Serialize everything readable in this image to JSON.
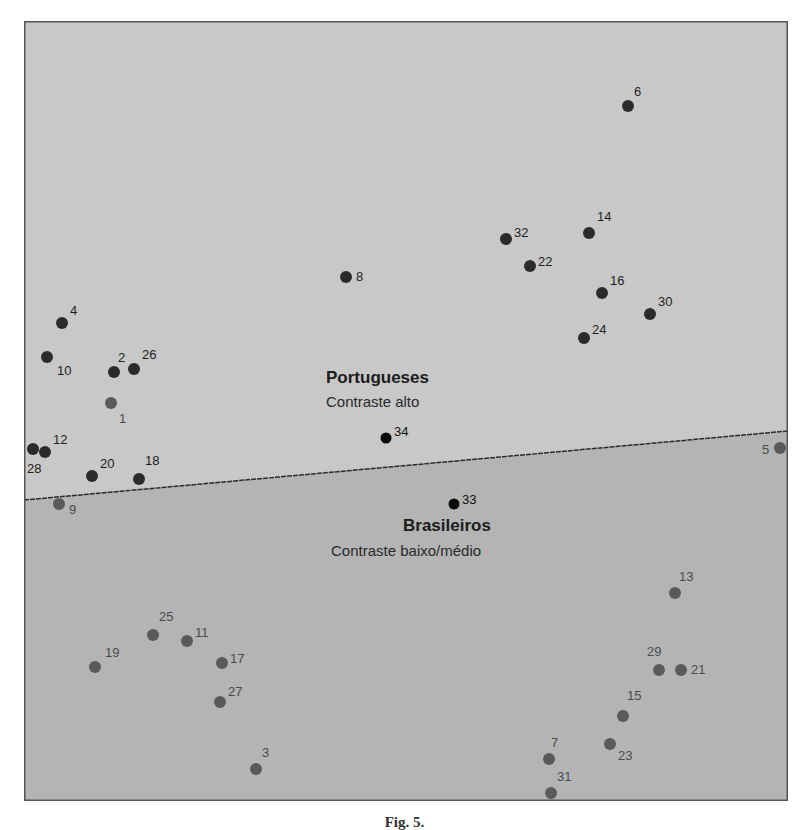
{
  "chart_data": {
    "type": "scatter",
    "title": "",
    "xlabel": "",
    "ylabel": "",
    "grid": false,
    "legend": "none",
    "regions": [
      {
        "name": "Portugueses",
        "subtitle": "Contraste alto",
        "fill": "#c8c8c8",
        "position": "above-line"
      },
      {
        "name": "Brasileiros",
        "subtitle": "Contraste baixo/médio",
        "fill": "#b4b4b4",
        "position": "below-line"
      }
    ],
    "divider_line": {
      "x1": 0,
      "y1": 479,
      "x2": 764,
      "y2": 410,
      "style": "dashed",
      "color": "#2a2a2a"
    },
    "points": [
      {
        "id": "1",
        "x": 87,
        "y": 382,
        "group": "Brasileiros",
        "label_dx": 8,
        "label_dy": 20
      },
      {
        "id": "2",
        "x": 90,
        "y": 351,
        "group": "Portugueses",
        "label_dx": 4,
        "label_dy": -10
      },
      {
        "id": "3",
        "x": 232,
        "y": 748,
        "group": "Brasileiros",
        "label_dx": 6,
        "label_dy": -12
      },
      {
        "id": "4",
        "x": 38,
        "y": 302,
        "group": "Portugueses",
        "label_dx": 8,
        "label_dy": -8
      },
      {
        "id": "5",
        "x": 756,
        "y": 427,
        "group": "Brasileiros",
        "label_dx": -18,
        "label_dy": 6
      },
      {
        "id": "6",
        "x": 604,
        "y": 85,
        "group": "Portugueses",
        "label_dx": 6,
        "label_dy": -10
      },
      {
        "id": "7",
        "x": 525,
        "y": 738,
        "group": "Brasileiros",
        "label_dx": 2,
        "label_dy": -12
      },
      {
        "id": "8",
        "x": 322,
        "y": 256,
        "group": "Portugueses",
        "label_dx": 10,
        "label_dy": 4
      },
      {
        "id": "9",
        "x": 35,
        "y": 483,
        "group": "Brasileiros",
        "label_dx": 10,
        "label_dy": 10
      },
      {
        "id": "10",
        "x": 23,
        "y": 336,
        "group": "Portugueses",
        "label_dx": 10,
        "label_dy": 18
      },
      {
        "id": "11",
        "x": 163,
        "y": 620,
        "group": "Brasileiros",
        "label_dx": 8,
        "label_dy": -4
      },
      {
        "id": "12",
        "x": 21,
        "y": 431,
        "group": "Portugueses",
        "label_dx": 8,
        "label_dy": -8
      },
      {
        "id": "13",
        "x": 651,
        "y": 572,
        "group": "Brasileiros",
        "label_dx": 4,
        "label_dy": -12
      },
      {
        "id": "14",
        "x": 565,
        "y": 212,
        "group": "Portugueses",
        "label_dx": 8,
        "label_dy": -12
      },
      {
        "id": "15",
        "x": 599,
        "y": 695,
        "group": "Brasileiros",
        "label_dx": 4,
        "label_dy": -16
      },
      {
        "id": "16",
        "x": 578,
        "y": 272,
        "group": "Portugueses",
        "label_dx": 8,
        "label_dy": -8
      },
      {
        "id": "17",
        "x": 198,
        "y": 642,
        "group": "Brasileiros",
        "label_dx": 8,
        "label_dy": 0
      },
      {
        "id": "18",
        "x": 115,
        "y": 458,
        "group": "Portugueses",
        "label_dx": 6,
        "label_dy": -14
      },
      {
        "id": "19",
        "x": 71,
        "y": 646,
        "group": "Brasileiros",
        "label_dx": 10,
        "label_dy": -10
      },
      {
        "id": "20",
        "x": 68,
        "y": 455,
        "group": "Portugueses",
        "label_dx": 8,
        "label_dy": -8
      },
      {
        "id": "21",
        "x": 657,
        "y": 649,
        "group": "Brasileiros",
        "label_dx": 10,
        "label_dy": 4
      },
      {
        "id": "22",
        "x": 506,
        "y": 245,
        "group": "Portugueses",
        "label_dx": 8,
        "label_dy": 0
      },
      {
        "id": "23",
        "x": 586,
        "y": 723,
        "group": "Brasileiros",
        "label_dx": 8,
        "label_dy": 16
      },
      {
        "id": "24",
        "x": 560,
        "y": 317,
        "group": "Portugueses",
        "label_dx": 8,
        "label_dy": -4
      },
      {
        "id": "25",
        "x": 129,
        "y": 614,
        "group": "Brasileiros",
        "label_dx": 6,
        "label_dy": -14
      },
      {
        "id": "26",
        "x": 110,
        "y": 348,
        "group": "Portugueses",
        "label_dx": 8,
        "label_dy": -10
      },
      {
        "id": "27",
        "x": 196,
        "y": 681,
        "group": "Brasileiros",
        "label_dx": 8,
        "label_dy": -6
      },
      {
        "id": "28",
        "x": 9,
        "y": 428,
        "group": "Portugueses",
        "label_dx": -6,
        "label_dy": 24
      },
      {
        "id": "29",
        "x": 635,
        "y": 649,
        "group": "Brasileiros",
        "label_dx": -12,
        "label_dy": -14
      },
      {
        "id": "30",
        "x": 626,
        "y": 293,
        "group": "Portugueses",
        "label_dx": 8,
        "label_dy": -8
      },
      {
        "id": "31",
        "x": 527,
        "y": 772,
        "group": "Brasileiros",
        "label_dx": 6,
        "label_dy": -12
      },
      {
        "id": "32",
        "x": 482,
        "y": 218,
        "group": "Portugueses",
        "label_dx": 8,
        "label_dy": -2
      },
      {
        "id": "33",
        "x": 430,
        "y": 483,
        "group": "Centroid",
        "label_dx": 8,
        "label_dy": 0
      },
      {
        "id": "34",
        "x": 362,
        "y": 417,
        "group": "Centroid",
        "label_dx": 8,
        "label_dy": -2
      }
    ],
    "group_colors": {
      "Portugueses": "#2b2b2b",
      "Brasileiros": "#5a5a5a",
      "Centroid": "#0a0a0a"
    },
    "label_colors": {
      "Portugueses": "#1e1e1e",
      "Brasileiros": "#4a4a4a",
      "Centroid": "#111111"
    },
    "region_labels": [
      {
        "title": "Portugueses",
        "subtitle": "Contraste alto",
        "x": 350,
        "y": 357
      },
      {
        "title": "Brasileiros",
        "subtitle": "Contraste baixo/médio",
        "x": 445,
        "y": 505
      }
    ]
  },
  "caption": "Fig. 5."
}
